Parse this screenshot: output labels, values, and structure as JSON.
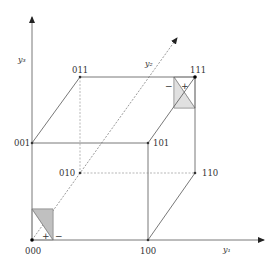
{
  "diagram": {
    "type": "boolean-cube",
    "axes": [
      {
        "id": "y1",
        "label": "y₁"
      },
      {
        "id": "y2",
        "label": "y₂"
      },
      {
        "id": "y3",
        "label": "y₃"
      }
    ],
    "vertices": [
      {
        "id": "000",
        "label": "000"
      },
      {
        "id": "100",
        "label": "100"
      },
      {
        "id": "010",
        "label": "010"
      },
      {
        "id": "110",
        "label": "110"
      },
      {
        "id": "001",
        "label": "001"
      },
      {
        "id": "101",
        "label": "101"
      },
      {
        "id": "011",
        "label": "011"
      },
      {
        "id": "111",
        "label": "111"
      }
    ],
    "markers": {
      "corner_000": {
        "plus": "+",
        "minus": "−"
      },
      "corner_111": {
        "plus": "+",
        "minus": "−"
      }
    },
    "colors": {
      "line": "#555555",
      "dashed": "#888888",
      "shade": "#c8c8c8",
      "vertex": "#333333"
    }
  }
}
